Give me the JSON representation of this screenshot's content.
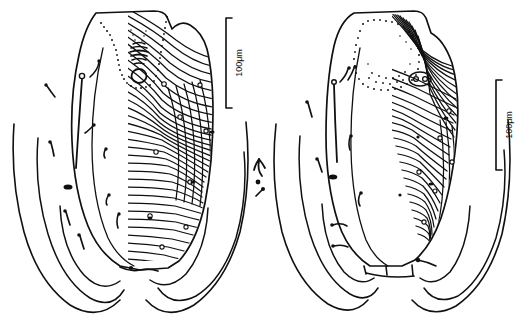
{
  "figure": {
    "type": "scientific-line-illustration",
    "background_color": "#ffffff",
    "ink_color": "#101010",
    "panel_count": 2,
    "caption": ""
  },
  "panels": [
    {
      "id": "left-panel",
      "name": "dorsal-view",
      "label": "",
      "description": "Broad ovoid idiosoma with dense wavy cuticular striations on the right half, scattered setae and lyrifissures on the left half, stippled arc and genital-like circular structure near the anterior margin, two pairs of curved legs at the posterior.",
      "features": {
        "striated_region": "right half",
        "smooth_region": "left half",
        "stipple_arc": "anterior",
        "pore_count_visible": 9,
        "setae_count_visible": 12,
        "leg_pairs": 2
      },
      "scalebar": {
        "name": "scale-bar-left",
        "label": "100μm",
        "orientation": "vertical",
        "length_px": 90,
        "x": 226,
        "y_top": 18,
        "y_bottom": 108
      }
    },
    {
      "id": "right-panel",
      "name": "ventral-view",
      "label": "",
      "description": "Narrower pyriform idiosoma with large stippled oval field at the anterior, dense vertical striations down the right side, sparse setae on the left, a transverse segmented band with small setae at the posterior, and two pairs of curved legs.",
      "features": {
        "striated_region": "right side",
        "smooth_region": "left side",
        "stipple_oval": "anterior",
        "transverse_band": true,
        "band_setae_count": 4,
        "pore_count_visible": 6,
        "setae_count_visible": 11,
        "leg_pairs": 2
      },
      "scalebar": {
        "name": "scale-bar-right",
        "label": "100μm",
        "orientation": "vertical",
        "length_px": 90,
        "x": 496,
        "y_top": 80,
        "y_bottom": 170
      }
    }
  ],
  "detached_setae": {
    "name": "detached-setae-group",
    "description": "Two small isolated setae drawn between the panels",
    "count": 2
  }
}
